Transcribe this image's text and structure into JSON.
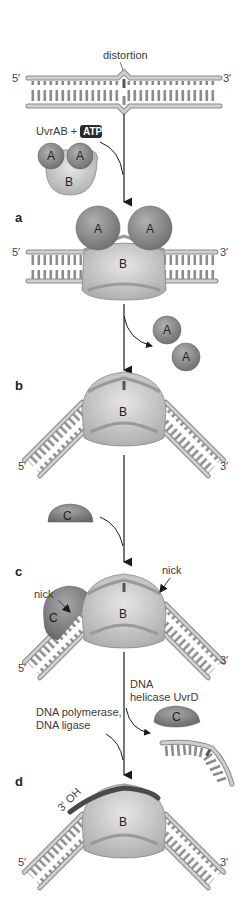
{
  "figure": {
    "colors": {
      "background": "#ffffff",
      "dna_backbone": "#c8c8c8",
      "dna_backbone_stroke": "#8a8a8a",
      "base_pair": "#8c8c8c",
      "protein_A": "#8a8a8a",
      "protein_B": "#c4c4c4",
      "protein_C": "#7e7e7e",
      "new_strand": "#4a4a4a",
      "atp_badge": "#2b2b2b",
      "arrow": "#1a1a1a"
    }
  },
  "top": {
    "distortion_label": "distortion",
    "end5": "5′",
    "end3": "3′",
    "reagent_label": "UvrAB +",
    "atp_badge": "ATP",
    "complex": {
      "a1": "A",
      "a2": "A",
      "b": "B"
    }
  },
  "steps": [
    {
      "letter": "a",
      "proteins": [
        "A",
        "A",
        "B"
      ],
      "end5": "5′",
      "end3": "3′",
      "released": [
        "A",
        "A"
      ]
    },
    {
      "letter": "b",
      "proteins": [
        "B"
      ],
      "end5": "5′",
      "end3": "3′",
      "incoming": "C"
    },
    {
      "letter": "c",
      "proteins": [
        "C",
        "B"
      ],
      "nick_left": "nick",
      "nick_right": "nick",
      "end5": "5′",
      "end3": "3′",
      "enzyme_right_line1": "DNA",
      "enzyme_right_line2": "helicase UvrD",
      "enzyme_left_line1": "DNA polymerase,",
      "enzyme_left_line2": "DNA ligase",
      "released": [
        "C",
        "excised oligonucleotide"
      ]
    },
    {
      "letter": "d",
      "proteins": [
        "B"
      ],
      "label_3oh": "3′ OH",
      "end5": "5′",
      "end3": "3′"
    }
  ]
}
